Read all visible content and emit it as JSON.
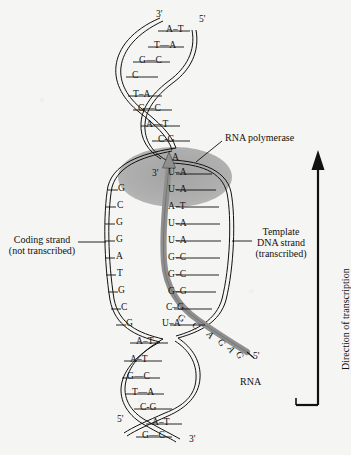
{
  "figure": {
    "title_alt": "DNA transcription: RNA polymerase synthesizing RNA from template DNA strand",
    "background_color": "#f5f5f3",
    "ink_color": "#111111",
    "polymerase_fill": "#a9a9a9",
    "rna_ribbon_color": "#8f8f8f"
  },
  "labels": {
    "rna_polymerase": "RNA polymerase",
    "coding_strand_line1": "Coding strand",
    "coding_strand_line2": "(not transcribed)",
    "template_line1": "Template",
    "template_line2": "DNA strand",
    "template_line3": "(transcribed)",
    "direction_of_transcription": "Direction of transcription",
    "rna": "RNA"
  },
  "primes": {
    "top_left": "3'",
    "top_right": "5'",
    "rna_start": "3'",
    "rna_end": "5'",
    "bottom_left": "5'",
    "bottom_right": "3'"
  },
  "duplex_top": {
    "note": "closed double helix above the transcription bubble; coding base on left, template base on right",
    "pairs": [
      {
        "left": "A",
        "right": "T"
      },
      {
        "left": "T",
        "right": "A"
      },
      {
        "left": "G",
        "right": "C"
      },
      {
        "left": "C",
        "right": "G"
      },
      {
        "left": "T",
        "right": "A"
      },
      {
        "left": "G",
        "right": "C"
      },
      {
        "left": "A",
        "right": "T"
      },
      {
        "left": "C",
        "right": "G"
      }
    ]
  },
  "bubble": {
    "note": "open transcription bubble; coding strand unpaired on left, RNA paired to template on right",
    "coding_unpaired": [
      "G",
      "C",
      "G",
      "G",
      "A",
      "T",
      "G",
      "C",
      "G"
    ],
    "rna_template_pairs": [
      {
        "rna": "A",
        "template": ""
      },
      {
        "rna": "U",
        "template": "A"
      },
      {
        "rna": "U",
        "template": "A"
      },
      {
        "rna": "A",
        "template": "T"
      },
      {
        "rna": "U",
        "template": "A"
      },
      {
        "rna": "U",
        "template": "A"
      },
      {
        "rna": "G",
        "template": "C"
      },
      {
        "rna": "G",
        "template": "C"
      },
      {
        "rna": "G",
        "template": "G"
      },
      {
        "rna": "C",
        "template": "G"
      },
      {
        "rna": "U",
        "template": "A"
      }
    ]
  },
  "duplex_bottom": {
    "note": "closed double helix below the transcription bubble",
    "pairs": [
      {
        "left": "A",
        "right": "T"
      },
      {
        "left": "A",
        "right": "T"
      },
      {
        "left": "G",
        "right": "C"
      },
      {
        "left": "T",
        "right": "A"
      },
      {
        "left": "C",
        "right": "G"
      },
      {
        "left": "A",
        "right": "T"
      },
      {
        "left": "G",
        "right": "C"
      }
    ]
  },
  "rna_tail": {
    "note": "free RNA transcript emerging from polymerase toward 5' end",
    "bases": [
      "G",
      "C",
      "A",
      "G",
      "A",
      "G"
    ]
  }
}
